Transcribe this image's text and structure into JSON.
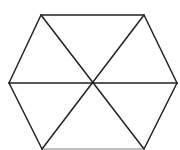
{
  "diagram": {
    "stroke_color": "#222222",
    "bottom_edge_color": "#aaaaaa",
    "background": "#ffffff",
    "stroke_width": 1.5,
    "center": [
      92,
      83
    ],
    "vertices": [
      {
        "name": "top-left",
        "x": 41,
        "y": 15
      },
      {
        "name": "top-right",
        "x": 144,
        "y": 15
      },
      {
        "name": "right",
        "x": 177,
        "y": 83
      },
      {
        "name": "bottom-right",
        "x": 144,
        "y": 149
      },
      {
        "name": "bottom-left",
        "x": 42,
        "y": 149
      },
      {
        "name": "left",
        "x": 9,
        "y": 83
      }
    ]
  }
}
